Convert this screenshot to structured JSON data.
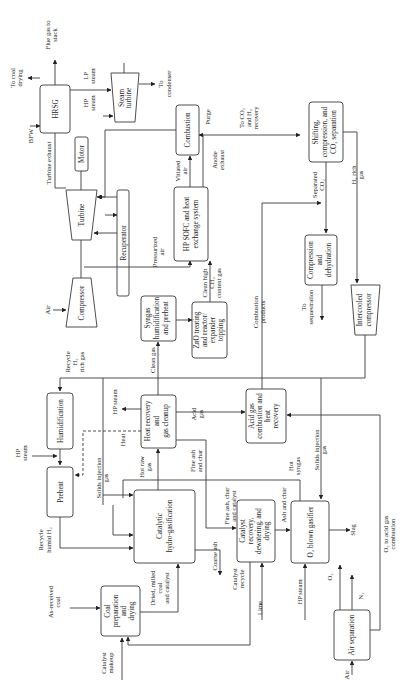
{
  "diagram": {
    "orientation": "rotated-90-ccw",
    "units": {
      "hrsg": "HRSG",
      "steam_turbine": [
        "Steam",
        "turbine"
      ],
      "motor": "Motor",
      "turbine": "Turbine",
      "compressor": "Compressor",
      "recuperator": "Recuperator",
      "combustion": "Combustion",
      "sofc": [
        "HP SOFC and heat",
        "exchange system"
      ],
      "shifting": [
        "Shifting,",
        "compression, and",
        "CO₂ separation"
      ],
      "syngas_humid": [
        "Syngas",
        "humidification",
        "and preheat"
      ],
      "zno": [
        "ZnO treating",
        "and reactor/",
        "expander",
        "topping"
      ],
      "compression_dehyd": [
        "Compression",
        "and",
        "dehydration"
      ],
      "intercooled": [
        "Intercooled",
        "compressor"
      ],
      "humidification": "Humidification",
      "preheat": "Preheat",
      "heat_recovery": [
        "Heat recovery",
        "and",
        "gas cleanup"
      ],
      "acid_gas": [
        "Acid gas",
        "combustion and",
        "heat",
        "recovery"
      ],
      "catalytic_hydro": [
        "Catalytic",
        "hydro-gasification"
      ],
      "catalyst_recovery": [
        "Catalyst",
        "recovery,",
        "dewatering, and",
        "drying"
      ],
      "o2_gasifier": "O₂ blown gasifier",
      "coal_prep": [
        "Coal",
        "preparation",
        "and",
        "drying"
      ],
      "air_sep": "Air separation"
    },
    "streams": {
      "to_coal_drying": [
        "To coal",
        "drying"
      ],
      "flue_gas": [
        "Flue gas to",
        "stack"
      ],
      "bfw": "BFW",
      "lp_steam": [
        "LP",
        "steam"
      ],
      "hp_steam_top": [
        "HP",
        "steam"
      ],
      "to_condenser": [
        "To",
        "condenser"
      ],
      "turbine_exhaust": "Turbine exhaust",
      "vitiated_air": [
        "Vitiated",
        "air"
      ],
      "purge": "Purge",
      "anode_exhaust": [
        "Anode",
        "exhaust"
      ],
      "to_co2_h2": [
        "To CO₂",
        "and H₂",
        "recovery"
      ],
      "separated_co2": [
        "Separated",
        "CO₂"
      ],
      "h2_rich_gas": [
        "H₂ rich",
        "gas"
      ],
      "air_left": "Air",
      "pressurized_air": [
        "Pressurized",
        "air"
      ],
      "clean_high_ch4": [
        "Clean high",
        "CH₄",
        "content gas"
      ],
      "combustion_products": [
        "Combustion",
        "products"
      ],
      "to_sequestration": [
        "To",
        "sequestration"
      ],
      "recycle_h2": [
        "Recycle",
        "H₂",
        "rich gas"
      ],
      "clean_gas": "Clean gas",
      "hp_steam_left": [
        "HP",
        "steam"
      ],
      "hp_steam_mid": "HP steam",
      "heat": "Heat",
      "acid_gas_stream": [
        "Acid",
        "gas"
      ],
      "hot_raw_gas": [
        "Hot raw",
        "gas"
      ],
      "fine_ash_char": [
        "Fine ash",
        "and char"
      ],
      "solids_injection_1": [
        "Solids injection",
        "gas"
      ],
      "solids_injection_2": [
        "Solids injection",
        "gas"
      ],
      "hot_syngas": [
        "Hot",
        "syngas"
      ],
      "fine_ash_char_cat": [
        "Fine ash, char",
        "and catalyst"
      ],
      "ash_and_char": "Ash and char",
      "recycle_humid_h2": [
        "Recycle",
        "humid H₂"
      ],
      "coarse_ash": "Coarse ash",
      "catalyst_recycle": [
        "Catalyst",
        "recycle"
      ],
      "dried_coal": [
        "Dried, milled",
        "coal",
        "and catalyst"
      ],
      "as_received_coal": [
        "As-received",
        "coal"
      ],
      "catalyst_makeup": [
        "Catalyst",
        "makeup"
      ],
      "lime": "Lime",
      "hp_steam_bottom": "HP steam",
      "slag": "Slag",
      "o2": "O₂",
      "n2": "N₂",
      "air_bottom": "Air",
      "o2_acid": [
        "O₂ to acid gas",
        "combustion"
      ]
    }
  }
}
